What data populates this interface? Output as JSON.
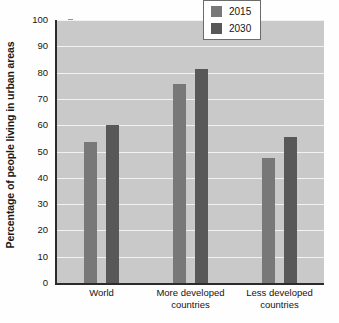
{
  "chart_data": {
    "type": "bar",
    "title": "",
    "xlabel": "",
    "ylabel": "Percentage of people living in urban areas",
    "categories": [
      "World",
      "More developed countries",
      "Less developed countries"
    ],
    "category_lines": [
      [
        "World"
      ],
      [
        "More developed",
        "countries"
      ],
      [
        "Less developed",
        "countries"
      ]
    ],
    "series": [
      {
        "name": "2015",
        "color": "#787878",
        "values": [
          53.5,
          75.5,
          47.5
        ]
      },
      {
        "name": "2030",
        "color": "#585858",
        "values": [
          60.0,
          81.5,
          55.5
        ]
      }
    ],
    "ylim": [
      0,
      100
    ],
    "yticks": [
      0,
      10,
      20,
      30,
      40,
      50,
      60,
      70,
      80,
      90,
      100
    ],
    "ytick_labels": [
      "0",
      "10",
      "20",
      "30",
      "40",
      "50",
      "60",
      "70",
      "80",
      "90",
      "100"
    ],
    "grid": true,
    "grid_color": "#f2f2f2",
    "plot_background": "#c9c9c9",
    "axis_color": "#2b2b2b",
    "legend_position": "top-right",
    "legend_entries": [
      "2015",
      "2030"
    ]
  }
}
